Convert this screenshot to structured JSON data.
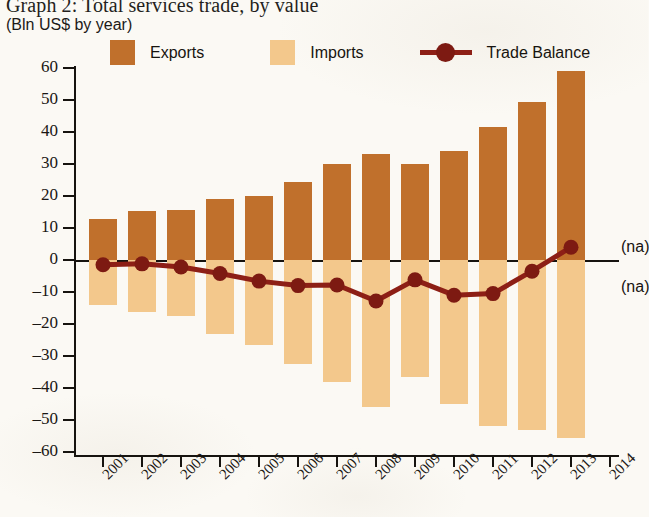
{
  "title": "Graph 2: Total services trade, by value",
  "subtitle": "(Bln US$ by year)",
  "legend": {
    "exports_label": "Exports",
    "imports_label": "Imports",
    "balance_label": "Trade Balance"
  },
  "annotations": {
    "na_upper": "(na)",
    "na_lower": "(na)"
  },
  "colors": {
    "exports": "#c0702c",
    "imports": "#f3c88c",
    "balance": "#8d1f16",
    "axis": "#16130f",
    "paper": "#fbf9f4"
  },
  "chart_data": {
    "type": "bar",
    "title": "Graph 2: Total services trade, by value",
    "subtitle": "(Bln US$ by year)",
    "xlabel": "",
    "ylabel": "Bln US$",
    "ylim": [
      -60,
      60
    ],
    "ytick_values": [
      60,
      50,
      40,
      30,
      20,
      10,
      0,
      -10,
      -20,
      -30,
      -40,
      -50,
      -60
    ],
    "ytick_labels": [
      "60",
      "50",
      "40",
      "30",
      "20",
      "10",
      "0",
      "–10",
      "–20",
      "–30",
      "–40",
      "–50",
      "–60"
    ],
    "grid": false,
    "legend_position": "top",
    "categories": [
      "2001",
      "2002",
      "2003",
      "2004",
      "2005",
      "2006",
      "2007",
      "2008",
      "2009",
      "2010",
      "2011",
      "2012",
      "2013"
    ],
    "xtick_labels": [
      "2001",
      "2002",
      "2003",
      "2004",
      "2005",
      "2006",
      "2007",
      "2008",
      "2009",
      "2010",
      "2011",
      "2012",
      "2013",
      "2014"
    ],
    "series": [
      {
        "name": "Exports",
        "type": "bar",
        "color": "#c0702c",
        "values": [
          12.8,
          15.4,
          15.6,
          19.0,
          20.0,
          24.5,
          30.0,
          33.0,
          30.0,
          34.0,
          41.5,
          49.5,
          59.0
        ]
      },
      {
        "name": "Imports",
        "type": "bar",
        "color": "#f3c88c",
        "values": [
          -14.0,
          -16.3,
          -17.5,
          -23.0,
          -26.5,
          -32.5,
          -38.0,
          -46.0,
          -36.5,
          -45.0,
          -52.0,
          -53.0,
          -55.5
        ]
      },
      {
        "name": "Trade Balance",
        "type": "line",
        "color": "#8d1f16",
        "values": [
          -1.5,
          -1.2,
          -2.2,
          -4.2,
          -6.6,
          -8.0,
          -7.8,
          -12.8,
          -6.2,
          -11.0,
          -10.5,
          -3.5,
          4.0
        ]
      }
    ]
  }
}
